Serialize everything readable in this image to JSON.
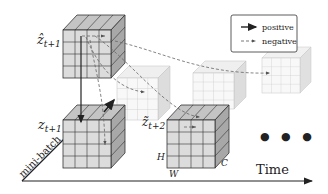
{
  "labels": {
    "z_hat": "ẑ",
    "z_hat_sub": "t+1",
    "z": "z",
    "z_sub": "t+1",
    "z_tilde": "z̃",
    "z_tilde_sub": "t+2",
    "H": "H",
    "W": "W",
    "C": "C",
    "time_axis": "Time",
    "batch_axis": "mini-batch"
  },
  "legend": {
    "items": [
      {
        "label": "positive",
        "style": "solid-arrow"
      },
      {
        "label": "negative",
        "style": "dashed-arrow"
      }
    ]
  },
  "ellipsis": "● ● ●",
  "colors": {
    "cube_face": "#d9d9d9",
    "cube_side": "#a8a8a8",
    "cube_top": "#c4c4c4",
    "faded_face": "#f0f0f0",
    "grid_line": "#333333",
    "dash_line": "#777777"
  }
}
